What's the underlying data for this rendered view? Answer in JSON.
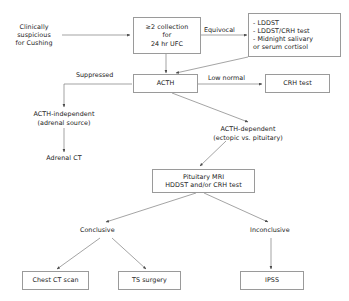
{
  "diagram": {
    "stroke_color": "#7d7d7d",
    "text_color": "#1a1a1a",
    "background": "#ffffff",
    "nodes": {
      "clinical_suspicion": {
        "lines": [
          "Clinically",
          "suspicious",
          "for Cushing"
        ],
        "boxed": false
      },
      "ufc": {
        "lines": [
          "≥2 collection",
          "for",
          "24 hr UFC"
        ],
        "boxed": true
      },
      "confirmatory_tests": {
        "lines": [
          "- LDDST",
          "- LDDST/CRH test",
          "- Midnight salivary",
          "or serum cortisol"
        ],
        "boxed": true
      },
      "acth": {
        "lines": [
          "ACTH"
        ],
        "boxed": true
      },
      "crh_test": {
        "lines": [
          "CRH test"
        ],
        "boxed": true
      },
      "acth_independent": {
        "lines": [
          "ACTH-independent",
          "(adrenal source)"
        ],
        "boxed": false
      },
      "adrenal_ct": {
        "lines": [
          "Adrenal CT"
        ],
        "boxed": false
      },
      "acth_dependent": {
        "lines": [
          "ACTH-dependent",
          "(ectopic vs. pituitary)"
        ],
        "boxed": false
      },
      "pituitary_mri": {
        "lines": [
          "Pituitary MRI",
          "HDDST and/or CRH test"
        ],
        "boxed": true
      },
      "chest_ct": {
        "lines": [
          "Chest CT scan"
        ],
        "boxed": true
      },
      "ts_surgery": {
        "lines": [
          "TS surgery"
        ],
        "boxed": true
      },
      "ipss": {
        "lines": [
          "IPSS"
        ],
        "boxed": true
      }
    },
    "edge_labels": {
      "equivocal": "Equivocal",
      "suppressed": "Suppressed",
      "low_normal": "Low normal",
      "conclusive": "Conclusive",
      "inconclusive": "Inconclusive"
    }
  }
}
